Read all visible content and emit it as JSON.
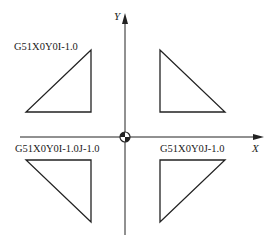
{
  "diagram": {
    "axes": {
      "x_label": "X",
      "y_label": "Y",
      "origin": "workpiece-origin-symbol"
    },
    "quadrants": [
      {
        "id": "top-left",
        "label": "G51X0Y0I-1.0"
      },
      {
        "id": "top-right",
        "label": ""
      },
      {
        "id": "bottom-left",
        "label": "G51X0Y0I-1.0J-1.0"
      },
      {
        "id": "bottom-right",
        "label": "G51X0Y0J-1.0"
      }
    ],
    "colors": {
      "line": "#222222",
      "background": "#ffffff"
    }
  }
}
